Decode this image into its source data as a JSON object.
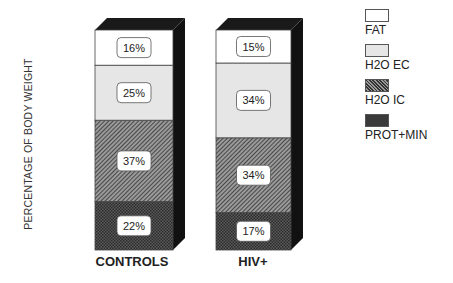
{
  "chart_data": {
    "type": "bar",
    "stacked": true,
    "three_d": true,
    "title": "",
    "xlabel": "",
    "ylabel": "PERCENTAGE OF BODY WEIGHT",
    "categories": [
      "CONTROLS",
      "HIV+"
    ],
    "series": [
      {
        "name": "PROT+MIN",
        "values": [
          22,
          17
        ],
        "pattern": "dark-crosshatch"
      },
      {
        "name": "H2O IC",
        "values": [
          37,
          34
        ],
        "pattern": "diagonal-hatch"
      },
      {
        "name": "H2O EC",
        "values": [
          25,
          34
        ],
        "pattern": "light-gray"
      },
      {
        "name": "FAT",
        "values": [
          16,
          15
        ],
        "pattern": "white"
      }
    ],
    "data_labels": {
      "CONTROLS": [
        "22%",
        "37%",
        "25%",
        "16%"
      ],
      "HIV+": [
        "17%",
        "34%",
        "34%",
        "15%"
      ]
    },
    "grid": false,
    "legend_position": "top-right"
  },
  "legend": [
    {
      "label": "FAT"
    },
    {
      "label": "H2O EC"
    },
    {
      "label": "H2O IC"
    },
    {
      "label": "PROT+MIN"
    }
  ],
  "axis": {
    "ylabel": "PERCENTAGE OF BODY WEIGHT"
  },
  "categories": {
    "c0": "CONTROLS",
    "c1": "HIV+"
  }
}
